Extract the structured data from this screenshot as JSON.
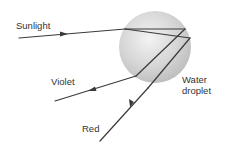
{
  "diagram": {
    "type": "rainbow-dispersion-in-water-droplet",
    "labels": {
      "sunlight": "Sunlight",
      "violet": "Violet",
      "water_line1": "Water",
      "water_line2": "droplet",
      "red": "Red"
    },
    "colors": {
      "ray": "#3a3a3a",
      "droplet_light": "#ededed",
      "droplet_dark": "#bdbdbd",
      "text": "#333333",
      "background": "#ffffff"
    },
    "droplet": {
      "cx": 155,
      "cy": 47,
      "r": 36
    },
    "rays": {
      "incoming": {
        "from": [
          19,
          38
        ],
        "to": [
          125,
          29
        ]
      },
      "inside_upper": {
        "from": [
          125,
          29
        ],
        "to": [
          185,
          29
        ]
      },
      "inside_lower": {
        "from": [
          125,
          29
        ],
        "to": [
          190,
          38
        ]
      },
      "violet_inside": {
        "from": [
          185,
          29
        ],
        "to": [
          136,
          76
        ]
      },
      "violet_out": {
        "from": [
          136,
          76
        ],
        "to": [
          55,
          101
        ]
      },
      "red_inside": {
        "from": [
          190,
          38
        ],
        "to": [
          148,
          88
        ]
      },
      "red_out": {
        "from": [
          148,
          88
        ],
        "to": [
          100,
          141
        ]
      }
    }
  }
}
